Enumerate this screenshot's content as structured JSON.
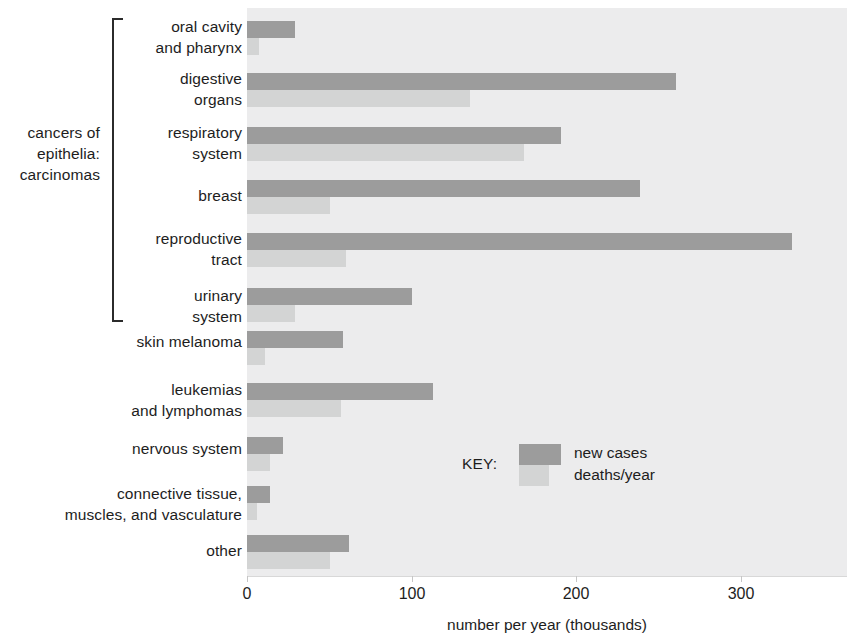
{
  "chart_data": {
    "type": "bar",
    "orientation": "horizontal",
    "title": "",
    "xlabel": "number per year (thousands)",
    "ylabel": "",
    "xlim": [
      0,
      364
    ],
    "xticks": [
      0,
      100,
      200,
      300
    ],
    "xtick_labels": [
      "0",
      "100",
      "200",
      "300"
    ],
    "grid": false,
    "legend_position": "inside-center-right",
    "categories": [
      "oral cavity and pharynx",
      "digestive organs",
      "respiratory system",
      "breast",
      "reproductive tract",
      "urinary system",
      "skin melanoma",
      "leukemias and lymphomas",
      "nervous system",
      "connective tissue, muscles, and vasculature",
      "other"
    ],
    "series": [
      {
        "name": "new cases",
        "color": "#9c9c9c",
        "values": [
          29,
          260,
          190,
          238,
          330,
          100,
          58,
          113,
          22,
          14,
          62
        ]
      },
      {
        "name": "deaths/year",
        "color": "#d3d4d4",
        "values": [
          7,
          135,
          168,
          50,
          60,
          29,
          11,
          57,
          14,
          6,
          50
        ]
      }
    ],
    "annotations": [
      {
        "text": "cancers of epithelia: carcinomas",
        "covers_categories": [
          "oral cavity and pharynx",
          "digestive organs",
          "respiratory system",
          "breast",
          "reproductive tract",
          "urinary system"
        ]
      }
    ]
  },
  "group_bracket": {
    "label_lines": [
      "cancers of",
      "epithelia:",
      "carcinomas"
    ]
  },
  "rows": [
    {
      "label_lines": [
        "oral cavity",
        "and pharynx"
      ],
      "new_cases": 29,
      "deaths": 7,
      "top": 14,
      "label_top": 16,
      "bar_top": 21
    },
    {
      "label_lines": [
        "digestive",
        "organs"
      ],
      "new_cases": 260,
      "deaths": 135,
      "top": 70,
      "label_top": 68,
      "bar_top": 73
    },
    {
      "label_lines": [
        "respiratory",
        "system"
      ],
      "new_cases": 190,
      "deaths": 168,
      "top": 122,
      "label_top": 122,
      "bar_top": 127
    },
    {
      "label_lines": [
        "breast"
      ],
      "new_cases": 238,
      "deaths": 50,
      "top": 176,
      "label_top": 185,
      "bar_top": 180
    },
    {
      "label_lines": [
        "reproductive",
        "tract"
      ],
      "new_cases": 330,
      "deaths": 60,
      "top": 228,
      "label_top": 228,
      "bar_top": 233
    },
    {
      "label_lines": [
        "urinary",
        "system"
      ],
      "new_cases": 100,
      "deaths": 29,
      "top": 283,
      "label_top": 285,
      "bar_top": 288
    },
    {
      "label_lines": [
        "skin melanoma"
      ],
      "new_cases": 58,
      "deaths": 11,
      "top": 330,
      "label_top": 331,
      "bar_top": 331
    },
    {
      "label_lines": [
        "leukemias",
        "and lymphomas"
      ],
      "new_cases": 113,
      "deaths": 57,
      "top": 379,
      "label_top": 379,
      "bar_top": 383
    },
    {
      "label_lines": [
        "nervous system"
      ],
      "new_cases": 22,
      "deaths": 14,
      "top": 436,
      "label_top": 438,
      "bar_top": 437
    },
    {
      "label_lines": [
        "connective tissue,",
        "muscles, and vasculature"
      ],
      "new_cases": 14,
      "deaths": 6,
      "top": 484,
      "label_top": 483,
      "bar_top": 486
    },
    {
      "label_lines": [
        "other"
      ],
      "new_cases": 62,
      "deaths": 50,
      "top": 533,
      "label_top": 540,
      "bar_top": 535
    }
  ],
  "legend": {
    "title": "KEY:",
    "entries": [
      {
        "label": "new cases",
        "color": "#9c9c9c"
      },
      {
        "label": "deaths/year",
        "color": "#d3d4d4"
      }
    ]
  },
  "axis": {
    "title": "number per year (thousands)",
    "ticks": [
      {
        "label": "0",
        "value": 0,
        "x": 247
      },
      {
        "label": "100",
        "value": 100,
        "x": 412
      },
      {
        "label": "200",
        "value": 200,
        "x": 576
      },
      {
        "label": "300",
        "value": 300,
        "x": 741
      }
    ]
  },
  "colors": {
    "new_cases": "#9c9c9c",
    "deaths": "#d3d4d4",
    "plot_background": "#ececed",
    "text": "#1d1d1d"
  }
}
